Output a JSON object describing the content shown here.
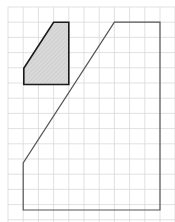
{
  "diagram": {
    "type": "grid-geometry",
    "canvas": {
      "width": 175,
      "height": 222,
      "background": "#ffffff"
    },
    "grid": {
      "color": "#d9d9d9",
      "line_width": 0.8,
      "vertical_lines_x": [
        8,
        23.2,
        38.4,
        53.6,
        68.8,
        84,
        99.2,
        114.4,
        129.6,
        144.8,
        160,
        175
      ],
      "horizontal_lines_y": [
        7,
        22.2,
        37.4,
        52.6,
        67.8,
        83,
        98.2,
        113.4,
        128.6,
        143.8,
        159,
        174.2,
        189.4,
        204.6,
        219.8
      ],
      "cell_size": 15.2
    },
    "shapes": [
      {
        "name": "small-shaded-shape",
        "points": "53.6,22.2 68.8,22.2 68.8,84.5 23.8,84.5 23.8,68.3",
        "fill": "#d6d6d6",
        "stroke": "#1a1a1a",
        "stroke_width": 1.6,
        "hatched": true
      },
      {
        "name": "large-outline-shape",
        "points": "114.4,22.2 160,22.2 160,210 23.2,210 23.2,163",
        "fill": "none",
        "stroke": "#555555",
        "stroke_width": 1.2,
        "hatched": false
      }
    ]
  }
}
